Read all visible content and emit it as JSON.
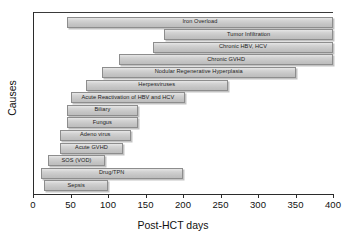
{
  "chart_data": {
    "type": "bar",
    "orientation": "horizontal",
    "subtype": "gantt-range",
    "title": "",
    "xlabel": "Post-HCT days",
    "ylabel": "Causes",
    "xlim": [
      0,
      400
    ],
    "xticks": [
      0,
      50,
      100,
      150,
      200,
      250,
      300,
      350,
      400
    ],
    "xticklabels": [
      "0",
      "50",
      "100",
      "150",
      "200",
      "250",
      "300",
      "350",
      "400"
    ],
    "grid": false,
    "legend": false,
    "bar_color": "#c8c8c8",
    "bar_edge_color": "#8d8d8d",
    "categories": [
      "Iron Overload",
      "Tumor Infiltration",
      "Chronic HBV, HCV",
      "Chronic GVHD",
      "Nodular Regenerative Hyperplasia",
      "Herpesviruses",
      "Acute Reactivation of HBV and HCV",
      "Biliary",
      "Fungus",
      "Adeno virus",
      "Acute GVHD",
      "SOS (VOD)",
      "Drug/TPN",
      "Sepsis"
    ],
    "bars": [
      {
        "label": "Iron Overload",
        "start": 45,
        "end": 400
      },
      {
        "label": "Tumor Infiltration",
        "start": 175,
        "end": 400
      },
      {
        "label": "Chronic HBV, HCV",
        "start": 160,
        "end": 400
      },
      {
        "label": "Chronic GVHD",
        "start": 115,
        "end": 400
      },
      {
        "label": "Nodular Regenerative Hyperplasia",
        "start": 92,
        "end": 350
      },
      {
        "label": "Herpesviruses",
        "start": 70,
        "end": 260
      },
      {
        "label": "Acute Reactivation of HBV and HCV",
        "start": 50,
        "end": 203
      },
      {
        "label": "Biliary",
        "start": 45,
        "end": 140
      },
      {
        "label": "Fungus",
        "start": 45,
        "end": 140
      },
      {
        "label": "Adeno virus",
        "start": 36,
        "end": 130
      },
      {
        "label": "Acute GVHD",
        "start": 36,
        "end": 120
      },
      {
        "label": "SOS (VOD)",
        "start": 20,
        "end": 96
      },
      {
        "label": "Drug/TPN",
        "start": 10,
        "end": 200
      },
      {
        "label": "Sepsis",
        "start": 15,
        "end": 100
      }
    ]
  }
}
